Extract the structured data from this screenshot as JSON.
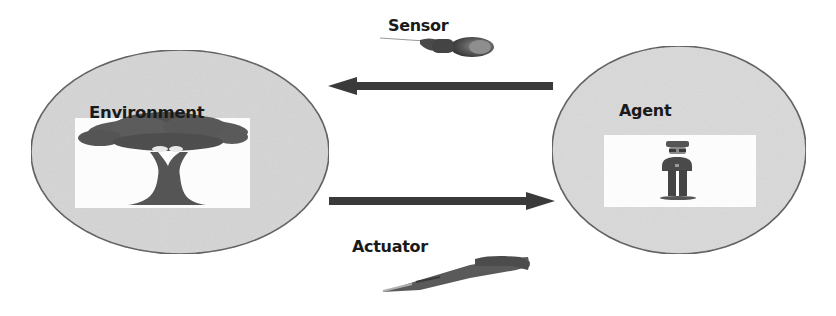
{
  "diagram": {
    "type": "agent-environment-loop",
    "nodes": [
      {
        "id": "environment",
        "label": "Environment",
        "icon": "tree-icon"
      },
      {
        "id": "agent",
        "label": "Agent",
        "icon": "person-icon"
      }
    ],
    "edges": [
      {
        "from": "environment",
        "to": "agent",
        "label": "Sensor",
        "icon": "sensor-icon",
        "direction": "agent-to-environment-arrow-left"
      },
      {
        "from": "agent",
        "to": "environment",
        "label": "Actuator",
        "icon": "actuator-icon",
        "direction": "environment-to-agent-arrow-right"
      }
    ]
  },
  "labels": {
    "environment": "Environment",
    "agent": "Agent",
    "sensor": "Sensor",
    "actuator": "Actuator"
  },
  "colors": {
    "ellipse_fill": "#d6d6d6",
    "ellipse_stroke": "#555555",
    "arrow": "#3a3a3a",
    "text": "#1a1a1a",
    "icon_dark": "#4a4a4a"
  }
}
